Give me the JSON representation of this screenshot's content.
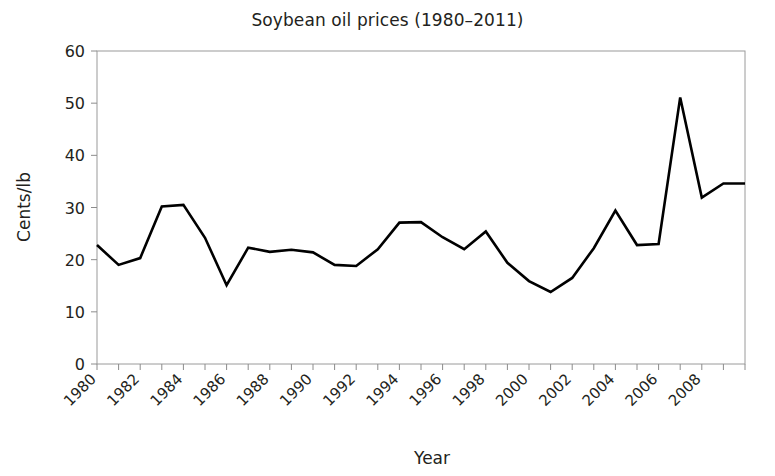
{
  "chart_data": {
    "type": "line",
    "title": "Soybean oil prices (1980–2011)",
    "xlabel": "Year",
    "ylabel": "Cents/lb",
    "x": [
      1980,
      1981,
      1982,
      1983,
      1984,
      1985,
      1986,
      1987,
      1988,
      1989,
      1990,
      1991,
      1992,
      1993,
      1994,
      1995,
      1996,
      1997,
      1998,
      1999,
      2000,
      2001,
      2002,
      2003,
      2004,
      2005,
      2006,
      2007,
      2008,
      2009,
      2010
    ],
    "values": [
      22.8,
      19.0,
      20.3,
      30.2,
      30.5,
      24.2,
      15.1,
      22.3,
      21.5,
      21.9,
      21.4,
      19.0,
      18.8,
      22.0,
      27.1,
      27.2,
      24.3,
      22.0,
      25.4,
      19.4,
      15.9,
      13.8,
      16.5,
      22.2,
      29.4,
      22.8,
      23.0,
      51.1,
      31.9,
      34.6,
      34.6
    ],
    "ylim": [
      0,
      60
    ],
    "ytick_values": [
      0,
      10,
      20,
      30,
      40,
      50,
      60
    ],
    "ytick_labels": [
      "0",
      "10",
      "20",
      "30",
      "40",
      "50",
      "60"
    ],
    "xlim": [
      1980,
      2010
    ],
    "xtick_values": [
      1980,
      1981,
      1982,
      1983,
      1984,
      1985,
      1986,
      1987,
      1988,
      1989,
      1990,
      1991,
      1992,
      1993,
      1994,
      1995,
      1996,
      1997,
      1998,
      1999,
      2000,
      2001,
      2002,
      2003,
      2004,
      2005,
      2006,
      2007,
      2008,
      2009,
      2010
    ],
    "xtick_labels": [
      "1980",
      "1982",
      "1984",
      "1986",
      "1988",
      "1990",
      "1992",
      "1994",
      "1996",
      "1998",
      "2000",
      "2002",
      "2004",
      "2006",
      "2008"
    ],
    "xtick_label_values": [
      1980,
      1982,
      1984,
      1986,
      1988,
      1990,
      1992,
      1994,
      1996,
      1998,
      2000,
      2002,
      2004,
      2006,
      2008
    ],
    "xtick_label_rotation": -45,
    "grid": false,
    "legend": null,
    "series_color": "#000000",
    "axis_color": "#8c8c8c",
    "text_color": "#231f20"
  }
}
